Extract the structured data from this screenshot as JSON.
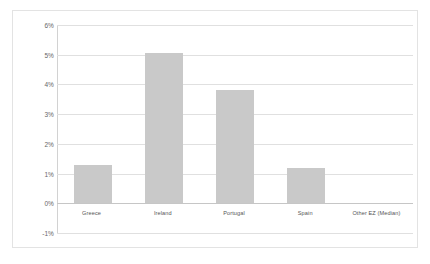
{
  "chart_data": {
    "type": "bar",
    "title": "",
    "subtitle": "",
    "xlabel": "",
    "ylabel": "",
    "categories": [
      "Greece",
      "Ireland",
      "Portugal",
      "Spain",
      "Other EZ (Median)"
    ],
    "values": [
      1.3,
      5.05,
      3.8,
      1.2,
      0.0
    ],
    "series": [
      {
        "name": "",
        "values": [
          1.3,
          5.05,
          3.8,
          1.2,
          0.0
        ]
      }
    ],
    "ylim": [
      -1,
      6
    ],
    "ytick_values": [
      6,
      5,
      4,
      3,
      2,
      1,
      0,
      -1
    ],
    "ytick_labels": [
      "6%",
      "5%",
      "4%",
      "3%",
      "2%",
      "1%",
      "0%",
      "-1%"
    ],
    "grid": true,
    "legend": "none",
    "bar_color": "#c9c9c9",
    "grid_color": "#e0e0e0",
    "axis_color": "#d2d2d2",
    "border_color": "#e3e3e3",
    "background_color": "#ffffff"
  }
}
